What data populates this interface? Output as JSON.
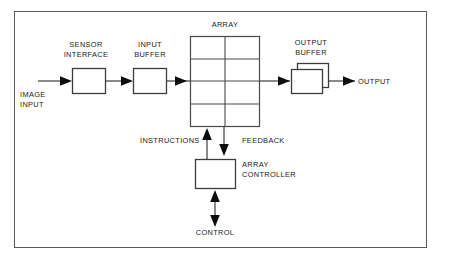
{
  "diagram": {
    "frame_color": "#5a5a5a",
    "line_color": "#3c3c3c",
    "background": "#ffffff",
    "nodes": {
      "sensor_interface": "SENSOR\nINTERFACE",
      "input_buffer": "INPUT\nBUFFER",
      "array": "ARRAY",
      "output_buffer": "OUTPUT\nBUFFER",
      "array_controller": "ARRAY\nCONTROLLER"
    },
    "ports": {
      "image_input": "IMAGE\nINPUT",
      "output": "OUTPUT",
      "control": "CONTROL"
    },
    "signals": {
      "instructions": "INSTRUCTIONS",
      "feedback": "FEEDBACK"
    },
    "array_grid": {
      "columns": 2,
      "rows": 4
    }
  }
}
